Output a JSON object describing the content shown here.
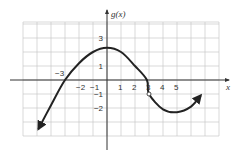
{
  "chart_data": {
    "type": "line",
    "title": "",
    "xlabel": "x",
    "ylabel": "g(x)",
    "grid": true,
    "xlim": [
      -6,
      8
    ],
    "ylim": [
      -4,
      4
    ],
    "x_tick_labels": [
      {
        "value": -3,
        "label": "−3",
        "pos": "above-left"
      },
      {
        "value": -2,
        "label": "−2"
      },
      {
        "value": -1,
        "label": "−1"
      },
      {
        "value": 1,
        "label": "1"
      },
      {
        "value": 2,
        "label": "2"
      },
      {
        "value": 3,
        "label": "3"
      },
      {
        "value": 4,
        "label": "4"
      },
      {
        "value": 5,
        "label": "5"
      }
    ],
    "y_tick_labels": [
      {
        "value": 3,
        "label": "3"
      },
      {
        "value": 1,
        "label": "1"
      },
      {
        "value": -1,
        "label": "−1"
      },
      {
        "value": -2,
        "label": "−2"
      }
    ],
    "series": [
      {
        "name": "g(x)",
        "x": [
          -4.9,
          -4,
          -3,
          -2,
          -1,
          0,
          1,
          2,
          2.85,
          3,
          4,
          5,
          6,
          6.7
        ],
        "y": [
          -3.5,
          -1.8,
          0,
          1.2,
          2.0,
          2.3,
          2.0,
          1.0,
          0,
          -1,
          -2.1,
          -2.3,
          -1.9,
          -1.1
        ],
        "arrows": [
          "start",
          "end"
        ],
        "color": "#222222"
      }
    ],
    "annotations": [
      {
        "type": "open-circle",
        "x": 3,
        "y": -1
      }
    ]
  },
  "colors": {
    "grid": "#c8c8c8",
    "axis": "#333333",
    "curve": "#222222"
  }
}
